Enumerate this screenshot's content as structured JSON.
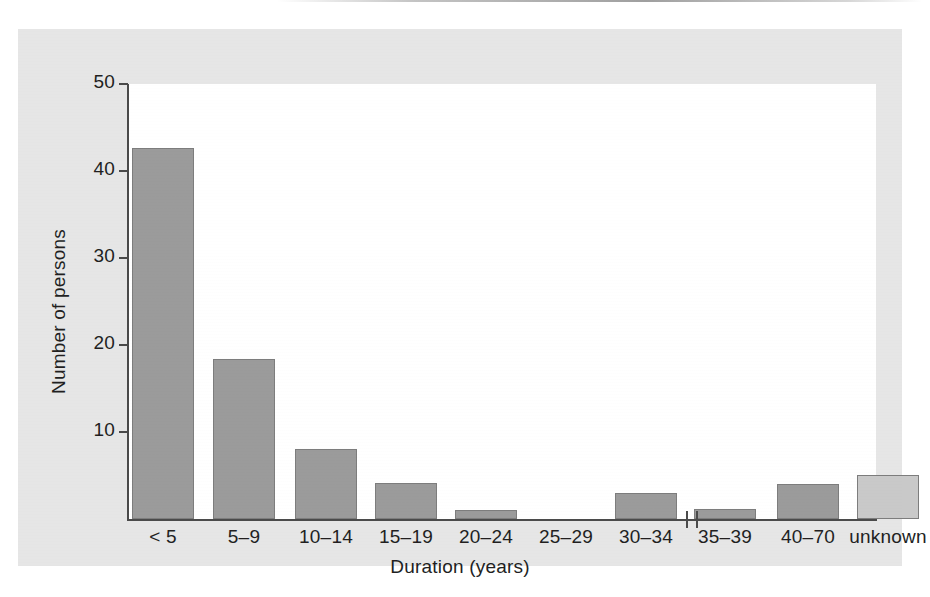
{
  "chart_data": {
    "type": "bar",
    "title": "",
    "subtitle": "",
    "xlabel": "Duration (years)",
    "ylabel": "Number of persons",
    "categories": [
      "< 5",
      "5–9",
      "10–14",
      "15–19",
      "20–24",
      "25–29",
      "30–34",
      "35–39",
      "40–70",
      "unknown"
    ],
    "values": [
      42.7,
      18.4,
      8.0,
      4.1,
      1.0,
      0.0,
      3.0,
      1.1,
      4.0,
      5.1
    ],
    "ylim": [
      0,
      50
    ],
    "yticks": [
      10,
      20,
      30,
      40,
      50
    ],
    "ytick_labels": [
      "10",
      "20",
      "30",
      "40",
      "50"
    ],
    "grid": false,
    "legend": false,
    "axis_break_after_category": "35–39"
  },
  "colors": {
    "bar_fill": "#9b9b9b",
    "bar_fill_unknown": "#c9c9c9",
    "bar_stroke": "#7d7d7d",
    "axis": "#4a4a4a",
    "text": "#221f1f",
    "panel_background": "#e6e6e6",
    "plot_background": "#ffffff"
  },
  "axes": {
    "y_title": "Number of persons",
    "x_title": "Duration (years)",
    "y_tick_values": [
      "50",
      "40",
      "30",
      "20",
      "10"
    ]
  }
}
